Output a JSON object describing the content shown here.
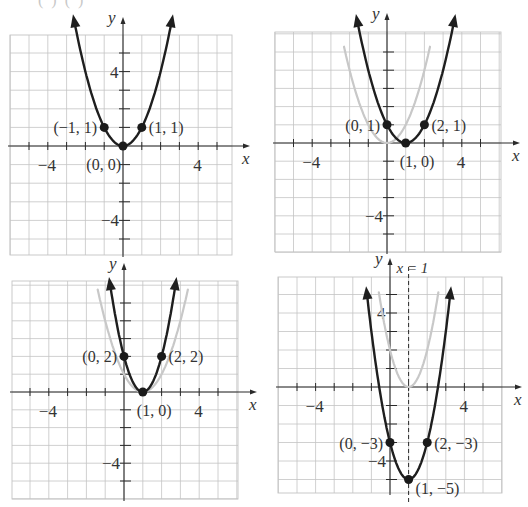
{
  "figure": {
    "top_cutoff_text": "(  )      (       )",
    "colors": {
      "grid": "#c4c4c4",
      "axis": "#2a2a2a",
      "curve": "#1e1e1e",
      "ghost_curve": "#c8c8c8",
      "point": "#1a1a1a",
      "text": "#333333"
    }
  },
  "chart_data": [
    {
      "type": "line",
      "panel": "top-left",
      "title": "",
      "xlabel": "x",
      "ylabel": "y",
      "xlim": [
        -6,
        6
      ],
      "ylim": [
        -6,
        6
      ],
      "grid": true,
      "x_tick_labels": [
        {
          "value": -4,
          "label": "−4"
        },
        {
          "value": 4,
          "label": "4"
        }
      ],
      "y_tick_labels": [
        {
          "value": 4,
          "label": "4"
        },
        {
          "value": -4,
          "label": "−4"
        }
      ],
      "series": [
        {
          "name": "y = x²",
          "role": "main",
          "a": 1,
          "h": 0,
          "k": 0,
          "x_range": [
            -2.6,
            2.6
          ]
        }
      ],
      "points": [
        {
          "x": -1,
          "y": 1,
          "label": "(−1, 1)",
          "label_side": "left"
        },
        {
          "x": 1,
          "y": 1,
          "label": "(1, 1)",
          "label_side": "right"
        },
        {
          "x": 0,
          "y": 0,
          "label": "(0, 0)",
          "label_side": "below-left"
        }
      ],
      "layout": {
        "ox": 123,
        "oy": 146,
        "ux": 18.8,
        "uy": 18.6,
        "gx0": 10,
        "gx1": 232,
        "gy0": 35,
        "gy1": 255,
        "arrow_top": 17,
        "arrow_right": 250
      }
    },
    {
      "type": "line",
      "panel": "top-right",
      "title": "",
      "xlabel": "x",
      "ylabel": "y",
      "xlim": [
        -6,
        6
      ],
      "ylim": [
        -6,
        6
      ],
      "grid": true,
      "x_tick_labels": [
        {
          "value": -4,
          "label": "−4"
        },
        {
          "value": 4,
          "label": "4"
        }
      ],
      "y_tick_labels": [
        {
          "value": -4,
          "label": "−4"
        }
      ],
      "series": [
        {
          "name": "y = x²",
          "role": "ghost",
          "a": 1,
          "h": 0,
          "k": 0,
          "x_range": [
            -2.3,
            2.3
          ]
        },
        {
          "name": "y = (x − 1)²",
          "role": "main",
          "a": 1,
          "h": 1,
          "k": 0,
          "x_range": [
            -1.6,
            3.6
          ]
        }
      ],
      "points": [
        {
          "x": 0,
          "y": 1,
          "label": "(0, 1)",
          "label_side": "left"
        },
        {
          "x": 2,
          "y": 1,
          "label": "(2, 1)",
          "label_side": "right"
        },
        {
          "x": 1,
          "y": 0,
          "label": "(1, 0)",
          "label_side": "below"
        }
      ],
      "layout": {
        "ox": 387,
        "oy": 143,
        "ux": 18.7,
        "uy": 18.2,
        "gx0": 275,
        "gx1": 501,
        "gy0": 32,
        "gy1": 252,
        "arrow_top": 13,
        "arrow_right": 520
      }
    },
    {
      "type": "line",
      "panel": "bottom-left",
      "title": "",
      "xlabel": "x",
      "ylabel": "y",
      "xlim": [
        -6,
        6
      ],
      "ylim": [
        -6,
        6
      ],
      "grid": true,
      "x_tick_labels": [
        {
          "value": -4,
          "label": "−4"
        },
        {
          "value": 4,
          "label": "4"
        }
      ],
      "y_tick_labels": [
        {
          "value": -4,
          "label": "−4"
        }
      ],
      "series": [
        {
          "name": "y = (x − 1)²",
          "role": "ghost",
          "a": 1,
          "h": 1,
          "k": 0,
          "x_range": [
            -1.4,
            3.4
          ]
        },
        {
          "name": "y = 2(x − 1)²",
          "role": "main",
          "a": 2,
          "h": 1,
          "k": 0,
          "x_range": [
            -0.75,
            2.75
          ]
        }
      ],
      "points": [
        {
          "x": 0,
          "y": 2,
          "label": "(0, 2)",
          "label_side": "left"
        },
        {
          "x": 2,
          "y": 2,
          "label": "(2, 2)",
          "label_side": "right"
        },
        {
          "x": 1,
          "y": 0,
          "label": "(1, 0)",
          "label_side": "below"
        }
      ],
      "layout": {
        "ox": 124,
        "oy": 392,
        "ux": 18.8,
        "uy": 17.8,
        "gx0": 12,
        "gx1": 238,
        "gy0": 281,
        "gy1": 499,
        "arrow_top": 263,
        "arrow_right": 257
      }
    },
    {
      "type": "line",
      "panel": "bottom-right",
      "title": "",
      "xlabel": "x",
      "ylabel": "y",
      "xlim": [
        -6,
        6
      ],
      "ylim": [
        -6,
        6
      ],
      "grid": true,
      "x_tick_labels": [
        {
          "value": -4,
          "label": "−4"
        },
        {
          "value": 4,
          "label": "4"
        }
      ],
      "y_tick_labels": [
        {
          "value": 4,
          "label": "4"
        },
        {
          "value": -4,
          "label": "−4"
        }
      ],
      "annotations": [
        {
          "type": "dashed-vertical",
          "x": 1,
          "label": "x = 1"
        }
      ],
      "series": [
        {
          "name": "y = 2(x − 1)²",
          "role": "ghost",
          "a": 2,
          "h": 1,
          "k": 0,
          "x_range": [
            -0.6,
            2.6
          ]
        },
        {
          "name": "y = 2(x − 1)² − 5",
          "role": "main",
          "a": 2,
          "h": 1,
          "k": -5,
          "x_range": [
            -1.25,
            3.25
          ]
        }
      ],
      "points": [
        {
          "x": 0,
          "y": -3,
          "label": "(0, −3)",
          "label_side": "left"
        },
        {
          "x": 2,
          "y": -3,
          "label": "(2, −3)",
          "label_side": "right"
        },
        {
          "x": 1,
          "y": -5,
          "label": "(1, −5)",
          "label_side": "right-below"
        }
      ],
      "layout": {
        "ox": 390,
        "oy": 387,
        "ux": 18.6,
        "uy": 18.5,
        "gx0": 278,
        "gx1": 502,
        "gy0": 277,
        "gy1": 493,
        "arrow_top": 258,
        "arrow_right": 522
      }
    }
  ]
}
